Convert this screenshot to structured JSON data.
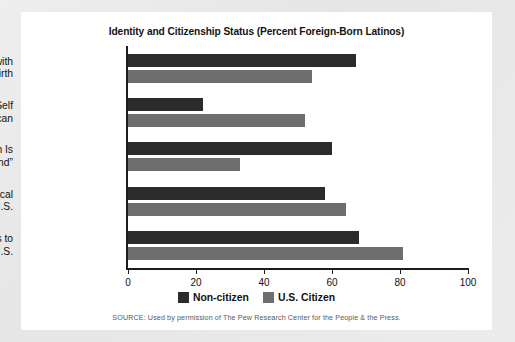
{
  "chart_data": {
    "type": "bar",
    "orientation": "horizontal",
    "title": "Identity and Citizenship Status (Percent Foreign-Born Latinos)",
    "xlabel": "",
    "ylabel": "",
    "xlim": [
      0,
      100
    ],
    "xticks": [
      0,
      20,
      40,
      60,
      80,
      100
    ],
    "grid": false,
    "legend_position": "bottom",
    "categories": [
      "Identifies Self with\nCountry of Birth",
      "Ever Describes Self\nas American",
      "Country of Birth Is\n“Real Homeland”",
      "Locus of Political\nConcern in U.S.",
      "Plans to\nStay in U.S."
    ],
    "series": [
      {
        "name": "Non-citizen",
        "color": "#2b2b2b",
        "values": [
          67,
          22,
          60,
          58,
          68
        ]
      },
      {
        "name": "U.S. Citizen",
        "color": "#6e6e6e",
        "values": [
          54,
          52,
          33,
          64,
          81
        ]
      }
    ],
    "source_note": "SOURCE: Used by permission of The Pew Research Center for the People & the Press."
  },
  "legend": {
    "items": [
      {
        "label": "Non-citizen"
      },
      {
        "label": "U.S. Citizen"
      }
    ]
  }
}
